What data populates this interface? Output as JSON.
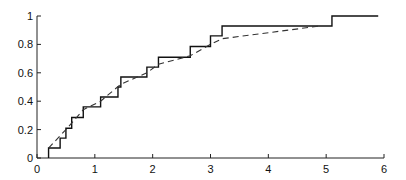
{
  "chart_data": {
    "type": "line",
    "title": "",
    "xlabel": "",
    "ylabel": "",
    "xlim": [
      0,
      6
    ],
    "ylim": [
      0,
      1
    ],
    "grid": false,
    "legend": null,
    "x_ticks": [
      "0",
      "1",
      "2",
      "3",
      "4",
      "5",
      "6"
    ],
    "y_ticks": [
      "0",
      "0.2",
      "0.4",
      "0.6",
      "0.8",
      "1"
    ],
    "series": [
      {
        "name": "empirical CDF (step)",
        "style": "solid",
        "x": [
          0.2,
          0.4,
          0.5,
          0.6,
          0.8,
          1.1,
          1.4,
          1.45,
          1.9,
          2.1,
          2.65,
          3.0,
          3.2,
          5.1,
          5.9
        ],
        "y": [
          0.07,
          0.14,
          0.21,
          0.285,
          0.36,
          0.43,
          0.5,
          0.57,
          0.64,
          0.71,
          0.785,
          0.86,
          0.93,
          1.0,
          1.0
        ]
      },
      {
        "name": "fitted CDF (dashed)",
        "style": "dashed",
        "x": [
          0.2,
          0.5,
          0.8,
          1.1,
          1.45,
          1.9,
          2.1,
          2.65,
          3.0,
          3.2,
          4.9
        ],
        "y": [
          0.07,
          0.2,
          0.34,
          0.4,
          0.52,
          0.6,
          0.66,
          0.72,
          0.8,
          0.84,
          0.93
        ]
      }
    ]
  }
}
